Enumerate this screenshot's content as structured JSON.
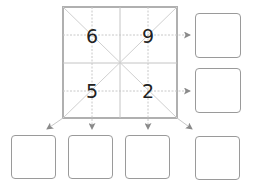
{
  "grid": {
    "cells": [
      {
        "position": "top-left",
        "value": "6"
      },
      {
        "position": "top-right",
        "value": "9"
      },
      {
        "position": "bottom-left",
        "value": "5"
      },
      {
        "position": "bottom-right",
        "value": "2"
      }
    ]
  },
  "answer_boxes": {
    "right": [
      {
        "id": "row-1",
        "value": ""
      },
      {
        "id": "row-2",
        "value": ""
      }
    ],
    "bottom": [
      {
        "id": "diagonal-left",
        "value": ""
      },
      {
        "id": "column-1",
        "value": ""
      },
      {
        "id": "column-2",
        "value": ""
      },
      {
        "id": "diagonal-right",
        "value": ""
      }
    ]
  },
  "colors": {
    "grid_border": "#b0b0b0",
    "grid_lines": "#cccccc",
    "arrow": "#8a8a8a",
    "box_border": "#9a9a9a",
    "digit": "#222222"
  }
}
